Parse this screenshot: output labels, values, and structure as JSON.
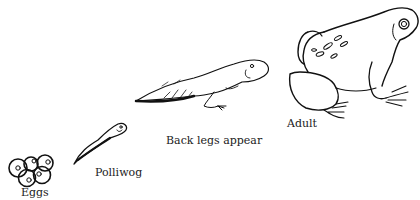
{
  "diagram": {
    "stages": [
      {
        "id": "eggs",
        "label": "Eggs"
      },
      {
        "id": "polliwog",
        "label": "Polliwog"
      },
      {
        "id": "back-legs",
        "label": "Back legs appear"
      },
      {
        "id": "adult",
        "label": "Adult"
      }
    ]
  }
}
